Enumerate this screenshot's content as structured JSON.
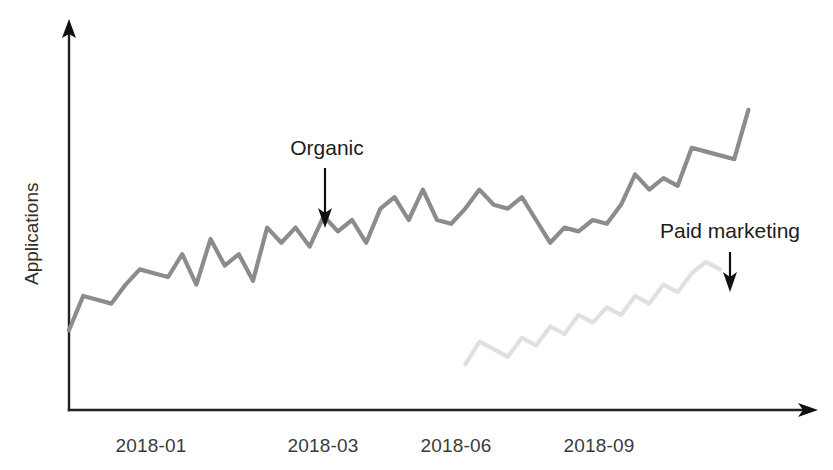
{
  "chart_data": {
    "type": "line",
    "title": "",
    "subtitle": "",
    "xlabel": "",
    "ylabel": "Applications",
    "grid": false,
    "legend_position": "inline-annotations",
    "xlim": [
      0,
      52
    ],
    "ylim": [
      0,
      100
    ],
    "x_tick_labels": [
      "2018-01",
      "2018-03",
      "2018-06",
      "2018-09"
    ],
    "x_tick_positions": [
      5.5,
      17.0,
      26.5,
      36.5
    ],
    "annotations": [
      {
        "text": "Organic",
        "series": "Organic",
        "arrow": "down",
        "x": 16.0,
        "y": 74
      },
      {
        "text": "Paid marketing",
        "series": "Paid marketing",
        "arrow": "down",
        "x": 45.0,
        "y": 44
      }
    ],
    "series": [
      {
        "name": "Organic",
        "color": "#8c8c8c",
        "x": [
          0,
          1,
          2,
          3,
          4,
          5,
          6,
          7,
          8,
          9,
          10,
          11,
          12,
          13,
          14,
          15,
          16,
          17,
          18,
          19,
          20,
          21,
          22,
          23,
          24,
          25,
          26,
          27,
          28,
          29,
          30,
          31,
          32,
          33,
          34,
          35,
          36,
          37,
          38,
          39,
          40,
          41,
          42,
          43,
          44,
          45,
          46,
          47,
          48
        ],
        "values": [
          21,
          30,
          29,
          28,
          33,
          37,
          36,
          35,
          41,
          33,
          45,
          38,
          41,
          34,
          48,
          44,
          48,
          43,
          51,
          47,
          50,
          44,
          53,
          56,
          50,
          58,
          50,
          49,
          53,
          58,
          54,
          53,
          56,
          50,
          44,
          48,
          47,
          50,
          49,
          54,
          62,
          58,
          61,
          59,
          69,
          68,
          67,
          66,
          79
        ]
      },
      {
        "name": "Paid marketing",
        "color": "#e0e0e0",
        "x": [
          28,
          29,
          30,
          31,
          32,
          33,
          34,
          35,
          36,
          37,
          38,
          39,
          40,
          41,
          42,
          43,
          44,
          45,
          46
        ],
        "values": [
          12,
          18,
          16,
          14,
          19,
          17,
          22,
          20,
          25,
          23,
          27,
          25,
          30,
          28,
          33,
          31,
          36,
          39,
          37
        ]
      }
    ]
  },
  "axes": {
    "y_axis_name": "y-axis",
    "x_axis_name": "x-axis",
    "y_arrow_direction": "up",
    "x_arrow_direction": "right"
  }
}
